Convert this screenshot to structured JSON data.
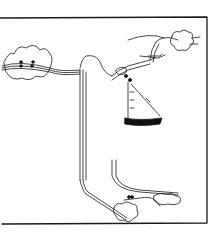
{
  "figure": {
    "colors": {
      "stroke": "#1a1a1a",
      "background": "#ffffff",
      "fill_dark": "#111111"
    }
  }
}
